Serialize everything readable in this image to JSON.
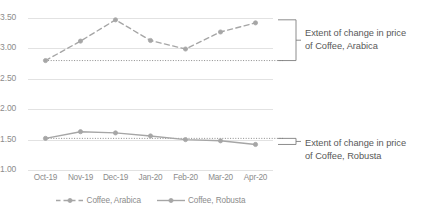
{
  "chart_data": {
    "type": "line",
    "title": "",
    "xlabel": "",
    "ylabel": "",
    "categories": [
      "Oct-19",
      "Nov-19",
      "Dec-19",
      "Jan-20",
      "Feb-20",
      "Mar-20",
      "Apr-20"
    ],
    "ylim": [
      1.0,
      3.5
    ],
    "yticks": [
      1.0,
      1.5,
      2.0,
      2.5,
      3.0,
      3.5
    ],
    "ytick_labels": [
      "1.00",
      "1.50",
      "2.00",
      "2.50",
      "3.00",
      "3.50"
    ],
    "grid": true,
    "legend_position": "bottom",
    "series": [
      {
        "name": "Coffee, Arabica",
        "style": "dashed",
        "color": "#a6a6a6",
        "marker": "circle",
        "values": [
          2.8,
          3.12,
          3.47,
          3.13,
          2.99,
          3.27,
          3.42
        ]
      },
      {
        "name": "Coffee, Robusta",
        "style": "solid",
        "color": "#a6a6a6",
        "marker": "circle",
        "values": [
          1.52,
          1.63,
          1.61,
          1.56,
          1.5,
          1.48,
          1.42
        ]
      }
    ],
    "reference_lines": [
      {
        "name": "arabica-baseline",
        "value": 2.8,
        "style": "dotted"
      },
      {
        "name": "robusta-baseline",
        "value": 1.52,
        "style": "dotted"
      }
    ],
    "annotations": [
      {
        "name": "arabica-extent",
        "line1": "Extent of change in price",
        "line2": "of Coffee, Arabica",
        "bracket_top_value": 3.47,
        "bracket_bottom_value": 2.8
      },
      {
        "name": "robusta-extent",
        "line1": "Extent of change in price",
        "line2": "of Coffee, Robusta",
        "bracket_top_value": 1.52,
        "bracket_bottom_value": 1.42
      }
    ]
  },
  "colors": {
    "series_line": "#a6a6a6",
    "gridline": "#e2e2e2",
    "axis_text": "#8c8c8c",
    "annotation_text": "#595959",
    "bracket": "#7f7f7f",
    "background": "#ffffff"
  }
}
